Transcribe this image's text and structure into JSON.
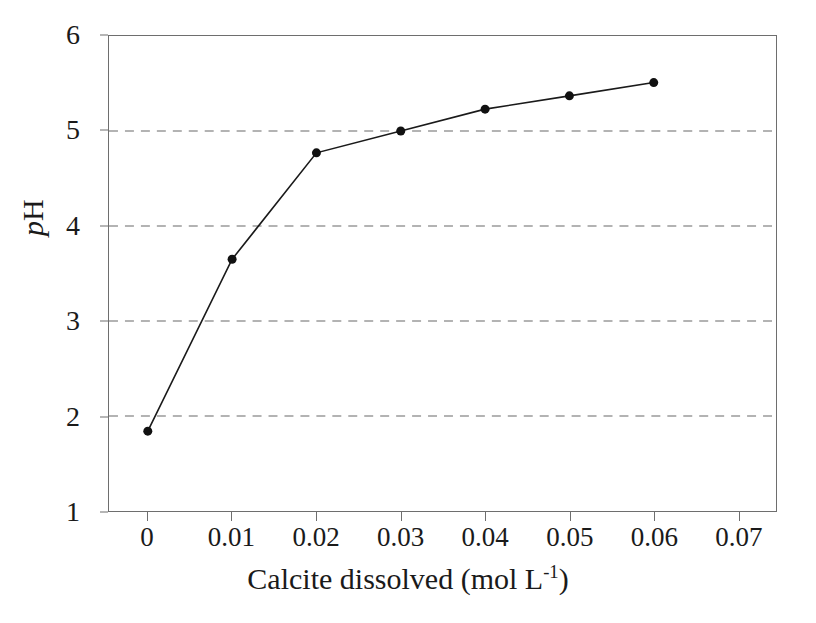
{
  "chart_data": {
    "type": "line",
    "title": "",
    "xlabel": "Calcite dissolved (mol L-1)",
    "xlabel_parts": {
      "base": "Calcite dissolved (mol L",
      "exponent": "-1",
      "tail": ")"
    },
    "ylabel": "pH",
    "ylabel_parts": {
      "italic": "p",
      "roman": "H"
    },
    "x": [
      0,
      0.01,
      0.02,
      0.03,
      0.04,
      0.05,
      0.06
    ],
    "values": [
      1.84,
      3.65,
      4.77,
      5.0,
      5.23,
      5.37,
      5.51
    ],
    "series": [
      {
        "name": "pH",
        "x": [
          0,
          0.01,
          0.02,
          0.03,
          0.04,
          0.05,
          0.06
        ],
        "values": [
          1.84,
          3.65,
          4.77,
          5.0,
          5.23,
          5.37,
          5.51
        ]
      }
    ],
    "xlim": [
      -0.0046,
      0.0745
    ],
    "ylim": [
      1,
      6
    ],
    "xticks": [
      0,
      0.01,
      0.02,
      0.03,
      0.04,
      0.05,
      0.06,
      0.07
    ],
    "xtick_labels": [
      "0",
      "0.01",
      "0.02",
      "0.03",
      "0.04",
      "0.05",
      "0.06",
      "0.07"
    ],
    "yticks": [
      1,
      2,
      3,
      4,
      5,
      6
    ],
    "ytick_labels": [
      "1",
      "2",
      "3",
      "4",
      "5",
      "6"
    ],
    "grid": {
      "horizontal": true,
      "vertical": false,
      "at": [
        2,
        3,
        4,
        5
      ],
      "style": "dashed",
      "color": "#9a9a9a"
    },
    "legend": null,
    "marker": {
      "shape": "circle",
      "filled": true,
      "color": "#111111",
      "size": 9
    },
    "line": {
      "color": "#1a1a1a",
      "width": 1.6,
      "style": "solid"
    },
    "frame": {
      "box": true,
      "color": "#6e6e6e"
    },
    "background": "#ffffff"
  }
}
